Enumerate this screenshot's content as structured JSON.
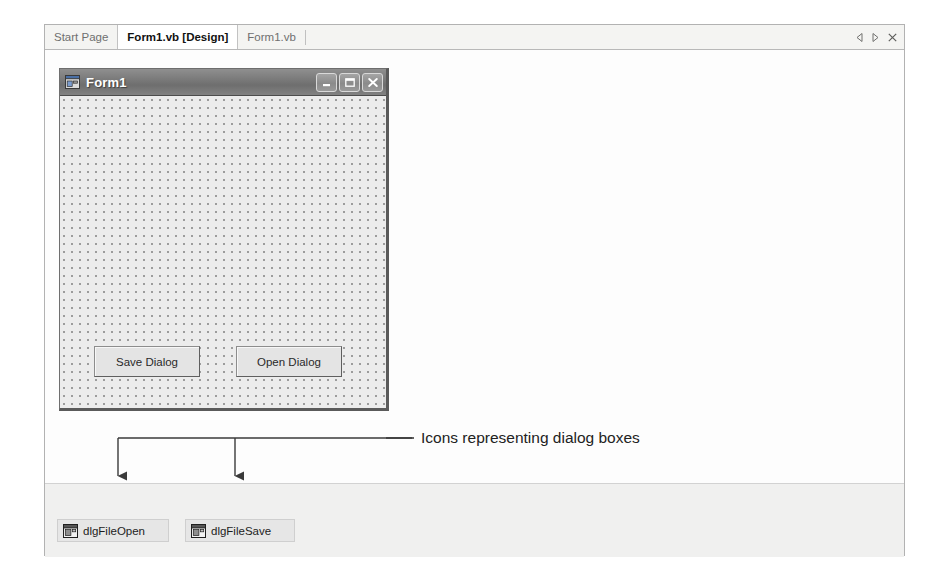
{
  "window": {
    "tabs": [
      {
        "label": "Start Page",
        "active": false
      },
      {
        "label": "Form1.vb [Design]",
        "active": true
      },
      {
        "label": "Form1.vb",
        "active": false
      }
    ],
    "tab_controls": {
      "prev_label": "Previous document",
      "next_label": "Next document",
      "close_label": "Close document"
    }
  },
  "designer": {
    "form": {
      "title": "Form1",
      "icon": "form-window-icon",
      "titlebar_buttons": {
        "minimize": "Minimize",
        "maximize": "Maximize",
        "close": "Close"
      },
      "controls": [
        {
          "name": "save-dialog",
          "label": "Save Dialog"
        },
        {
          "name": "open-dialog",
          "label": "Open Dialog"
        }
      ]
    },
    "component_tray": {
      "items": [
        {
          "name": "dlgFileOpen",
          "label": "dlgFileOpen",
          "icon": "dialog-component-icon"
        },
        {
          "name": "dlgFileSave",
          "label": "dlgFileSave",
          "icon": "dialog-component-icon"
        }
      ]
    }
  },
  "annotation": {
    "text": "Icons representing dialog boxes",
    "callout_color": "#3a3a3a"
  },
  "colors": {
    "frame_border": "#b2b2b2",
    "tab_strip_bg": "#f4f4f2",
    "active_tab_bg": "#ffffff",
    "canvas_bg": "#fdfdfd",
    "form_titlebar": "#7b7b7b",
    "form_client_bg": "#ececec",
    "grid_dot": "#9c9c9c",
    "tray_bg": "#f0f0ef",
    "tray_item_bg": "#e6e6e6",
    "button_face": "#e4e4e4",
    "annotation_text": "#222222"
  }
}
